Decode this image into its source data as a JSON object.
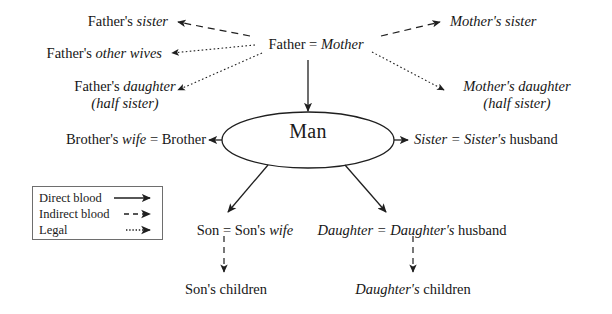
{
  "diagram": {
    "center": {
      "label": "Man"
    },
    "nodes": {
      "fathers_sister": {
        "prefix": "Father's ",
        "emph": "sister"
      },
      "fathers_other_wives": {
        "prefix": "Father's ",
        "emph": "other wives"
      },
      "fathers_daughter": {
        "prefix": "Father's ",
        "emph": "daughter",
        "sub": "(half sister)"
      },
      "brothers_wife_brother": {
        "prefix": "Brother's ",
        "emph": "wife",
        "suffix": " = Brother"
      },
      "father_mother": {
        "prefix": "Father = ",
        "emph": "Mother"
      },
      "mothers_sister": {
        "emph": "Mother's sister"
      },
      "mothers_daughter": {
        "emph": "Mother's daughter",
        "sub": "(half sister)"
      },
      "sister_sisters_husband": {
        "emph": "Sister = Sister's",
        "suffix": " husband"
      },
      "son_sons_wife": {
        "prefix": "Son = Son's ",
        "emph": "wife"
      },
      "daughter_daughters_husband": {
        "emph": "Daughter = Daughter's",
        "suffix": " husband"
      },
      "sons_children": {
        "prefix": "Son's children"
      },
      "daughters_children": {
        "emph": "Daughter's",
        "suffix": " children"
      }
    },
    "legend": {
      "items": [
        {
          "label": "Direct blood",
          "style": "solid",
          "icon": "solid-arrow-icon"
        },
        {
          "label": "Indirect blood",
          "style": "dashed",
          "icon": "dashed-arrow-icon"
        },
        {
          "label": "Legal",
          "style": "dotted",
          "icon": "dotted-arrow-icon"
        }
      ]
    },
    "edges": [
      {
        "name": "father-mother-to-fathers-sister",
        "style": "dashed"
      },
      {
        "name": "father-mother-to-mothers-sister",
        "style": "dashed"
      },
      {
        "name": "father-mother-to-fathers-other-wives",
        "style": "dotted"
      },
      {
        "name": "father-mother-to-fathers-daughter",
        "style": "dotted"
      },
      {
        "name": "father-mother-to-mothers-daughter",
        "style": "dotted"
      },
      {
        "name": "father-mother-to-man",
        "style": "solid"
      },
      {
        "name": "man-to-brother",
        "style": "solid"
      },
      {
        "name": "man-to-sister",
        "style": "solid"
      },
      {
        "name": "man-to-son",
        "style": "solid"
      },
      {
        "name": "man-to-daughter",
        "style": "solid"
      },
      {
        "name": "son-to-sons-children",
        "style": "dashed"
      },
      {
        "name": "daughter-to-daughters-children",
        "style": "dashed"
      }
    ],
    "colors": {
      "ink": "#161616",
      "stroke": "#1f1f1f",
      "legend_border": "#6e6e6e"
    }
  }
}
